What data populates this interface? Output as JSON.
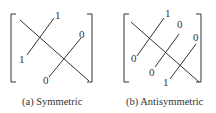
{
  "figure": {
    "panels": [
      {
        "id": "a",
        "caption": "(a) Symmetric",
        "labels": [
          "1",
          "1",
          "0",
          "0"
        ]
      },
      {
        "id": "b",
        "caption": "(b) Antisymmetric",
        "labels": [
          "1",
          "0",
          "0",
          "0",
          "0",
          "1"
        ]
      }
    ]
  }
}
